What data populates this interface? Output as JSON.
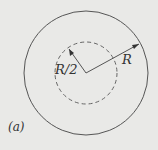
{
  "figure": {
    "panel_label": "(a)",
    "outer_radius_label": "R",
    "inner_radius_label": "R/2",
    "outer_circle": {
      "style": "solid"
    },
    "inner_circle": {
      "style": "dashed"
    },
    "colors": {
      "background": "#e9e9e7",
      "stroke": "#555555"
    }
  }
}
